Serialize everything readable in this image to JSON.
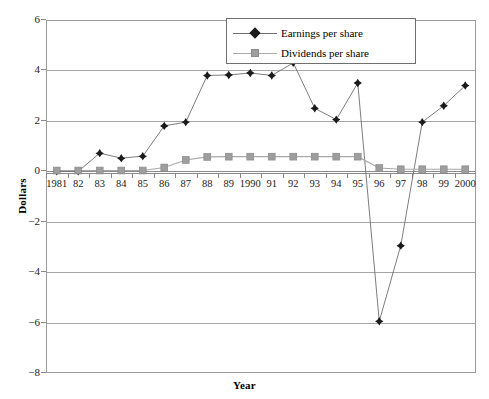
{
  "chart_data": {
    "type": "line",
    "title": "",
    "xlabel": "Year",
    "ylabel": "Dollars",
    "categories": [
      "1981",
      "82",
      "83",
      "84",
      "85",
      "86",
      "87",
      "88",
      "89",
      "1990",
      "91",
      "92",
      "93",
      "94",
      "95",
      "96",
      "97",
      "98",
      "99",
      "2000"
    ],
    "series": [
      {
        "name": "Earnings per share",
        "marker": "diamond",
        "color": "#1a1a1a",
        "line_color": "#6e6e6e",
        "values": [
          0,
          0,
          0.72,
          0.52,
          0.6,
          1.8,
          1.95,
          3.8,
          3.82,
          3.9,
          3.8,
          4.3,
          2.5,
          2.05,
          3.5,
          -5.95,
          -2.95,
          1.95,
          2.6,
          3.4
        ]
      },
      {
        "name": "Dividends per share",
        "marker": "square",
        "color": "#9e9e9e",
        "line_color": "#a8a8a8",
        "values": [
          0.03,
          0.03,
          0.03,
          0.03,
          0.03,
          0.15,
          0.45,
          0.57,
          0.58,
          0.58,
          0.58,
          0.58,
          0.58,
          0.58,
          0.58,
          0.13,
          0.08,
          0.08,
          0.08,
          0.08
        ]
      }
    ],
    "ylim": [
      -8,
      6
    ],
    "yticks": [
      6,
      4,
      2,
      0,
      -2,
      -4,
      -6,
      -8
    ],
    "ytick_labels": [
      "6",
      "4",
      "2",
      "0",
      "−2",
      "−4",
      "−6",
      "−8"
    ],
    "grid": true,
    "grid_axis": "y",
    "legend_position": "top-right",
    "legend_entries": [
      "Earnings per share",
      "Dividends per share"
    ]
  }
}
